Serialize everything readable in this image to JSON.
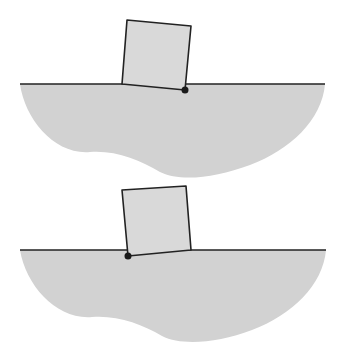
{
  "diagram": {
    "colors": {
      "background": "#ffffff",
      "body_fill": "#d2d2d2",
      "block_fill": "#d9d9d9",
      "stroke": "#222222",
      "pivot": "#1a1a1a"
    },
    "panels": [
      {
        "id": "top",
        "surface_y": 84,
        "block": {
          "points": "127,20 191,26 185,90 122,84"
        },
        "pivot": {
          "x": 185,
          "y": 90,
          "side": "right"
        }
      },
      {
        "id": "bottom",
        "surface_y": 250,
        "block": {
          "points": "122,190 186,186 191,250 128,256"
        },
        "pivot": {
          "x": 128,
          "y": 256,
          "side": "left"
        }
      }
    ]
  }
}
